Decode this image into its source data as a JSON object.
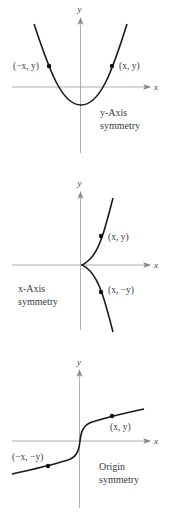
{
  "colors": {
    "background": "#ffffff",
    "axis": "#9a9a9a",
    "curve": "#1a1a1a",
    "point": "#111111",
    "text": "#3a3a3a"
  },
  "panels": [
    {
      "id": "y-axis-symmetry",
      "axis_labels": {
        "x": "x",
        "y": "y"
      },
      "points": [
        {
          "label": "(−x, y)",
          "x": 49,
          "y": 66
        },
        {
          "label": "(x, y)",
          "x": 112,
          "y": 66
        }
      ],
      "caption": {
        "line1": "y-Axis",
        "line2": "symmetry"
      }
    },
    {
      "id": "x-axis-symmetry",
      "axis_labels": {
        "x": "x",
        "y": "y"
      },
      "points": [
        {
          "label": "(x, y)",
          "x": 101,
          "y": 236
        },
        {
          "label": "(x, −y)",
          "x": 101,
          "y": 292
        }
      ],
      "caption": {
        "line1": "x-Axis",
        "line2": "symmetry"
      }
    },
    {
      "id": "origin-symmetry",
      "axis_labels": {
        "x": "x",
        "y": "y"
      },
      "points": [
        {
          "label": "(x, y)",
          "x": 112,
          "y": 416
        },
        {
          "label": "(−x, −y)",
          "x": 48,
          "y": 466
        }
      ],
      "caption": {
        "line1": "Origin",
        "line2": "symmetry"
      }
    }
  ]
}
